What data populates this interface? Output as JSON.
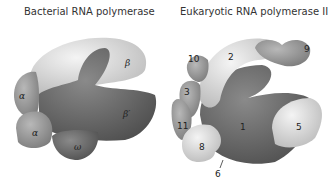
{
  "titles": {
    "left": "Bacterial RNA polymerase",
    "right": "Eukaryotic RNA polymerase II"
  },
  "bacterial": {
    "subunits": [
      "β",
      "β′",
      "α",
      "α",
      "ω"
    ]
  },
  "eukaryotic": {
    "subunits": [
      "1",
      "2",
      "3",
      "5",
      "6",
      "8",
      "9",
      "10",
      "11"
    ]
  },
  "colors": {
    "dark": "#6e6e6e",
    "mid": "#9a9a9a",
    "light": "#d6d6d6",
    "lightest": "#ececec"
  }
}
